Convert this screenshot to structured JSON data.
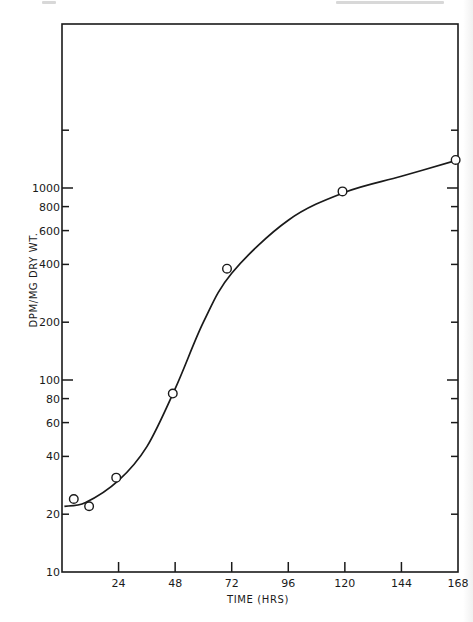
{
  "chart_data": {
    "type": "line",
    "title": "",
    "xlabel": "TIME (HRS)",
    "ylabel": "DPM/MG DRY WT.",
    "yscale": "log",
    "xlim": [
      0,
      168
    ],
    "ylim": [
      10,
      10000
    ],
    "grid": false,
    "legend": null,
    "x_ticks": [
      24,
      48,
      72,
      96,
      120,
      144,
      168
    ],
    "x_tick_labels": [
      "24",
      "48",
      "72",
      "96",
      "120",
      "144",
      "168"
    ],
    "y_ticks": [
      10,
      20,
      40,
      60,
      80,
      100,
      200,
      400,
      600,
      800,
      1000,
      2000
    ],
    "y_tick_labels": [
      "10",
      "20",
      "40",
      "60",
      "80",
      "100",
      "200",
      "400",
      "600",
      "800",
      "1000",
      ""
    ],
    "series": [
      {
        "name": "observed",
        "marker": "open-circle",
        "x": [
          5,
          11.5,
          23,
          47,
          70,
          119,
          167
        ],
        "y": [
          24,
          22,
          31,
          85,
          380,
          960,
          1400
        ]
      },
      {
        "name": "fitted-curve",
        "marker": "none",
        "style": "smooth-sigmoid",
        "x": [
          1,
          10,
          24,
          36,
          48,
          60,
          72,
          96,
          120,
          144,
          168
        ],
        "y": [
          22,
          23,
          30,
          45,
          90,
          200,
          360,
          680,
          950,
          1150,
          1400
        ]
      }
    ]
  },
  "labels": {
    "xlabel": "TIME (HRS)",
    "ylabel": "DPM/MG DRY WT."
  }
}
